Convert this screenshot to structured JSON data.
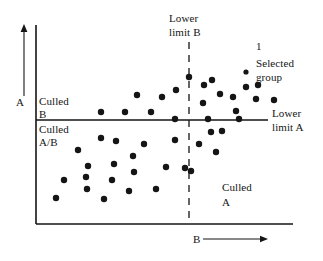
{
  "figure": {
    "type": "scatter-annotated-diagram",
    "background_color": "#ffffff",
    "ink_color": "#151515",
    "axes": {
      "x_axis_label": "B",
      "x_axis_arrow": "────────▶",
      "y_axis_label": "A",
      "x_origin_px": 36,
      "y_origin_px": 224,
      "x_end_px": 293,
      "y_top_px": 25
    },
    "threshold_lines": {
      "horizontal": {
        "label_line1": "Lower",
        "label_line2": "limit A",
        "style": "solid",
        "y_px": 120,
        "x_start_px": 36,
        "x_end_px": 268
      },
      "vertical": {
        "label_line1": "Lower",
        "label_line2": "limit B",
        "style": "dashed",
        "x_px": 189,
        "y_start_px": 42,
        "y_end_px": 224
      }
    },
    "quadrant_labels": [
      {
        "name": "culled-b",
        "line1": "Culled",
        "line2": "B",
        "x": 39,
        "y": 95
      },
      {
        "name": "culled-ab",
        "line1": "Culled",
        "line2": "A/B",
        "x": 39,
        "y": 123
      },
      {
        "name": "culled-a",
        "line1": "Culled",
        "line2": "A",
        "x": 222,
        "y": 181
      }
    ],
    "callout": {
      "marker_number": "1",
      "marker_number_x": 256,
      "marker_number_y": 40,
      "legend_dot_x": 246,
      "legend_dot_y": 72,
      "line1": "Selected",
      "line2": "group",
      "text_x": 256,
      "text_y": 57
    }
  },
  "chart_data": {
    "type": "scatter",
    "title": "",
    "xlabel": "B",
    "ylabel": "A",
    "grid": false,
    "legend": [
      "Selected group"
    ],
    "annotations": [
      "Lower limit A",
      "Lower limit B",
      "Culled B",
      "Culled A/B",
      "Culled A",
      "Selected group",
      "1"
    ],
    "thresholds": {
      "lower_limit_A_y_px": 120,
      "lower_limit_B_x_px": 189
    },
    "xlim_px": [
      36,
      293
    ],
    "ylim_px": [
      224,
      25
    ],
    "points_px": [
      {
        "x": 101,
        "y": 112,
        "group": "culled-b"
      },
      {
        "x": 125,
        "y": 112,
        "group": "culled-b"
      },
      {
        "x": 151,
        "y": 112,
        "group": "culled-b"
      },
      {
        "x": 137,
        "y": 95,
        "group": "culled-b"
      },
      {
        "x": 162,
        "y": 97,
        "group": "culled-b"
      },
      {
        "x": 176,
        "y": 90,
        "group": "culled-b"
      },
      {
        "x": 175,
        "y": 119,
        "group": "culled-b"
      },
      {
        "x": 189,
        "y": 77,
        "group": "selected"
      },
      {
        "x": 204,
        "y": 85,
        "group": "selected"
      },
      {
        "x": 212,
        "y": 80,
        "group": "selected"
      },
      {
        "x": 233,
        "y": 97,
        "group": "selected"
      },
      {
        "x": 220,
        "y": 94,
        "group": "selected"
      },
      {
        "x": 246,
        "y": 87,
        "group": "selected"
      },
      {
        "x": 258,
        "y": 85,
        "group": "selected"
      },
      {
        "x": 256,
        "y": 99,
        "group": "selected"
      },
      {
        "x": 203,
        "y": 103,
        "group": "selected"
      },
      {
        "x": 236,
        "y": 111,
        "group": "selected"
      },
      {
        "x": 208,
        "y": 119,
        "group": "selected"
      },
      {
        "x": 239,
        "y": 119,
        "group": "selected"
      },
      {
        "x": 274,
        "y": 100,
        "group": "selected"
      },
      {
        "x": 56,
        "y": 198,
        "group": "culled-ab"
      },
      {
        "x": 64,
        "y": 180,
        "group": "culled-ab"
      },
      {
        "x": 78,
        "y": 150,
        "group": "culled-ab"
      },
      {
        "x": 88,
        "y": 166,
        "group": "culled-ab"
      },
      {
        "x": 87,
        "y": 189,
        "group": "culled-ab"
      },
      {
        "x": 86,
        "y": 177,
        "group": "culled-ab"
      },
      {
        "x": 101,
        "y": 138,
        "group": "culled-ab"
      },
      {
        "x": 104,
        "y": 199,
        "group": "culled-ab"
      },
      {
        "x": 114,
        "y": 164,
        "group": "culled-ab"
      },
      {
        "x": 112,
        "y": 180,
        "group": "culled-ab"
      },
      {
        "x": 116,
        "y": 141,
        "group": "culled-ab"
      },
      {
        "x": 129,
        "y": 191,
        "group": "culled-ab"
      },
      {
        "x": 134,
        "y": 172,
        "group": "culled-ab"
      },
      {
        "x": 133,
        "y": 156,
        "group": "culled-ab"
      },
      {
        "x": 144,
        "y": 144,
        "group": "culled-ab"
      },
      {
        "x": 156,
        "y": 189,
        "group": "culled-ab"
      },
      {
        "x": 166,
        "y": 167,
        "group": "culled-ab"
      },
      {
        "x": 175,
        "y": 140,
        "group": "culled-ab"
      },
      {
        "x": 185,
        "y": 168,
        "group": "culled-ab"
      },
      {
        "x": 191,
        "y": 171,
        "group": "culled-a"
      },
      {
        "x": 199,
        "y": 144,
        "group": "culled-a"
      },
      {
        "x": 211,
        "y": 132,
        "group": "culled-a"
      },
      {
        "x": 222,
        "y": 131,
        "group": "culled-a"
      },
      {
        "x": 216,
        "y": 152,
        "group": "culled-a"
      }
    ]
  }
}
